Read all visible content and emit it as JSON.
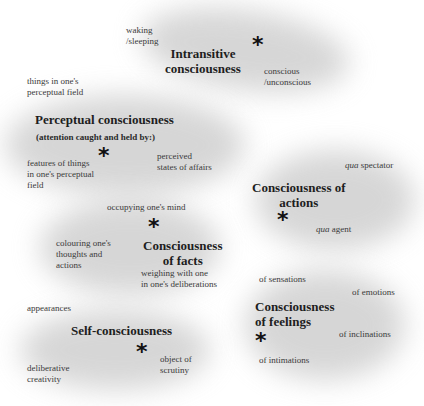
{
  "nodes": {
    "intransitive": {
      "title": "Intransitive\nconsciousness",
      "labels": [
        "waking\n/sleeping",
        "conscious\n/unconscious"
      ]
    },
    "perceptual": {
      "title": "Perceptual consciousness",
      "subtitle": "(attention caught and held by:)",
      "labels": [
        "things in one's\nperceptual field",
        "features of things\nin one's perceptual\nfield",
        "perceived\nstates of affairs"
      ]
    },
    "actions": {
      "title": "Consciousness of\nactions",
      "labels": [
        "spectator",
        "agent"
      ],
      "qua": "qua"
    },
    "facts": {
      "title": "Consciousness\nof facts",
      "labels": [
        "occupying one's mind",
        "colouring one's\nthoughts and\nactions",
        "weighing with one\nin one's deliberations"
      ]
    },
    "self": {
      "title": "Self-consciousness",
      "labels": [
        "appearances",
        "deliberative\ncreativity",
        "object of\nscrutiny"
      ]
    },
    "feelings": {
      "title": "Consciousness\nof feelings",
      "labels": [
        "of sensations",
        "of emotions",
        "of inclinations",
        "of intimations"
      ]
    },
    "star_glyph": "*"
  }
}
